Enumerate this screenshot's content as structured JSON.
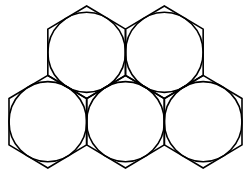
{
  "figure": {
    "stroke_color": "#000000",
    "background": "#ffffff",
    "rows": [
      {
        "row": "top",
        "count": 2
      },
      {
        "row": "bottom",
        "count": 3
      }
    ],
    "shapes": [
      {
        "id": "hex-top-left",
        "cx": 1.732,
        "cy": 1.0
      },
      {
        "id": "hex-top-right",
        "cx": 3.464,
        "cy": 1.0
      },
      {
        "id": "hex-bottom-left",
        "cx": 0.866,
        "cy": 2.5
      },
      {
        "id": "hex-bottom-middle",
        "cx": 2.598,
        "cy": 2.5
      },
      {
        "id": "hex-bottom-right",
        "cx": 4.33,
        "cy": 2.5
      }
    ]
  }
}
